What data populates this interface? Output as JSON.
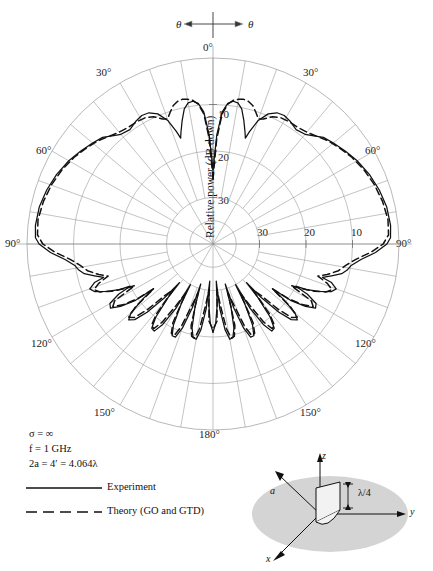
{
  "figure": {
    "top_axis": {
      "left_symbol": "θ",
      "right_symbol": "θ"
    },
    "radial_axis_title": "Relative power (dB down)"
  },
  "chart_data": {
    "type": "line",
    "plot_kind": "polar-radiation-pattern",
    "title": "",
    "xlabel": "θ (degrees)",
    "ylabel": "Relative power (dB down)",
    "angle_unit": "degrees",
    "angle_tick_labels": [
      "0°",
      "30°",
      "60°",
      "90°",
      "120°",
      "150°",
      "180°"
    ],
    "angle_ticks": [
      0,
      30,
      60,
      90,
      120,
      150,
      180
    ],
    "angle_range": [
      -180,
      180
    ],
    "radial_tick_labels": [
      "10",
      "20",
      "30"
    ],
    "radial_ticks_db_down": [
      10,
      20,
      30
    ],
    "radial_range_db_down": [
      0,
      40
    ],
    "radial_center_db_down": 40,
    "grid": true,
    "legend_position": "lower-left",
    "series": [
      {
        "name": "Experiment",
        "style": "solid",
        "color": "#111111",
        "points_deg_db": [
          [
            0,
            24.0
          ],
          [
            2,
            16.5
          ],
          [
            4,
            11.5
          ],
          [
            6,
            9.6
          ],
          [
            8,
            9.0
          ],
          [
            10,
            9.2
          ],
          [
            12,
            10.3
          ],
          [
            14,
            12.6
          ],
          [
            16,
            15.0
          ],
          [
            17,
            16.2
          ],
          [
            18,
            14.6
          ],
          [
            20,
            11.8
          ],
          [
            23,
            9.6
          ],
          [
            26,
            8.6
          ],
          [
            29,
            8.4
          ],
          [
            32,
            8.8
          ],
          [
            36,
            9.6
          ],
          [
            40,
            9.2
          ],
          [
            43,
            8.2
          ],
          [
            46,
            7.0
          ],
          [
            50,
            6.2
          ],
          [
            55,
            5.2
          ],
          [
            60,
            4.2
          ],
          [
            66,
            3.2
          ],
          [
            72,
            2.4
          ],
          [
            78,
            1.8
          ],
          [
            84,
            1.6
          ],
          [
            88,
            1.8
          ],
          [
            90,
            2.6
          ],
          [
            93,
            5.0
          ],
          [
            96,
            8.0
          ],
          [
            99,
            10.0
          ],
          [
            101,
            10.6
          ],
          [
            103,
            11.6
          ],
          [
            105,
            13.6
          ],
          [
            107,
            15.4
          ],
          [
            108,
            13.2
          ],
          [
            110,
            11.8
          ],
          [
            112,
            12.6
          ],
          [
            114,
            15.0
          ],
          [
            116,
            17.6
          ],
          [
            117,
            20.0
          ],
          [
            118,
            17.0
          ],
          [
            120,
            14.4
          ],
          [
            122,
            14.0
          ],
          [
            124,
            16.0
          ],
          [
            126,
            19.4
          ],
          [
            127,
            24.0
          ],
          [
            128,
            21.0
          ],
          [
            130,
            17.0
          ],
          [
            132,
            15.6
          ],
          [
            134,
            16.6
          ],
          [
            136,
            19.6
          ],
          [
            138,
            24.5
          ],
          [
            139,
            29.0
          ],
          [
            140,
            25.0
          ],
          [
            142,
            20.0
          ],
          [
            144,
            17.6
          ],
          [
            146,
            17.4
          ],
          [
            148,
            19.6
          ],
          [
            150,
            24.0
          ],
          [
            151,
            30.0
          ],
          [
            152,
            25.5
          ],
          [
            154,
            20.6
          ],
          [
            156,
            18.4
          ],
          [
            158,
            18.4
          ],
          [
            160,
            20.8
          ],
          [
            162,
            25.6
          ],
          [
            163,
            31.0
          ],
          [
            164,
            26.0
          ],
          [
            166,
            21.4
          ],
          [
            168,
            19.4
          ],
          [
            170,
            19.2
          ],
          [
            172,
            21.4
          ],
          [
            174,
            26.0
          ],
          [
            175,
            32.0
          ],
          [
            176,
            27.0
          ],
          [
            178,
            23.0
          ],
          [
            180,
            21.0
          ]
        ]
      },
      {
        "name": "Theory (GO and GTD)",
        "style": "dashed",
        "color": "#111111",
        "points_deg_db": [
          [
            0,
            26.0
          ],
          [
            2,
            17.5
          ],
          [
            4,
            12.0
          ],
          [
            6,
            9.8
          ],
          [
            8,
            8.8
          ],
          [
            10,
            8.4
          ],
          [
            12,
            8.2
          ],
          [
            14,
            8.4
          ],
          [
            16,
            9.0
          ],
          [
            18,
            10.2
          ],
          [
            20,
            11.4
          ],
          [
            22,
            11.0
          ],
          [
            25,
            9.8
          ],
          [
            28,
            9.2
          ],
          [
            32,
            9.0
          ],
          [
            36,
            9.0
          ],
          [
            40,
            8.6
          ],
          [
            44,
            7.8
          ],
          [
            48,
            6.8
          ],
          [
            53,
            5.8
          ],
          [
            58,
            4.8
          ],
          [
            64,
            3.8
          ],
          [
            70,
            3.0
          ],
          [
            76,
            2.4
          ],
          [
            82,
            2.0
          ],
          [
            87,
            2.2
          ],
          [
            90,
            3.4
          ],
          [
            93,
            6.0
          ],
          [
            96,
            9.0
          ],
          [
            99,
            11.0
          ],
          [
            102,
            12.4
          ],
          [
            105,
            14.6
          ],
          [
            107,
            16.4
          ],
          [
            109,
            14.0
          ],
          [
            111,
            12.6
          ],
          [
            113,
            13.6
          ],
          [
            115,
            16.0
          ],
          [
            117,
            19.0
          ],
          [
            118,
            21.0
          ],
          [
            120,
            15.6
          ],
          [
            122,
            14.6
          ],
          [
            124,
            16.6
          ],
          [
            126,
            20.0
          ],
          [
            127,
            24.0
          ],
          [
            129,
            18.6
          ],
          [
            131,
            16.0
          ],
          [
            133,
            16.8
          ],
          [
            135,
            20.0
          ],
          [
            137,
            25.0
          ],
          [
            139,
            27.0
          ],
          [
            141,
            20.6
          ],
          [
            143,
            18.0
          ],
          [
            145,
            17.8
          ],
          [
            147,
            20.0
          ],
          [
            149,
            24.6
          ],
          [
            151,
            28.0
          ],
          [
            153,
            21.0
          ],
          [
            155,
            18.8
          ],
          [
            157,
            18.6
          ],
          [
            159,
            21.0
          ],
          [
            161,
            26.0
          ],
          [
            163,
            29.0
          ],
          [
            165,
            21.8
          ],
          [
            167,
            19.6
          ],
          [
            169,
            19.4
          ],
          [
            171,
            21.6
          ],
          [
            173,
            26.4
          ],
          [
            175,
            30.0
          ],
          [
            177,
            23.4
          ],
          [
            180,
            21.6
          ]
        ]
      }
    ],
    "annotations": [
      {
        "text": "σ = ∞"
      },
      {
        "text": "f = 1 GHz"
      },
      {
        "text": "2a = 4′ = 4.064λ"
      }
    ]
  },
  "legend": {
    "items": [
      {
        "label": "Experiment",
        "style": "solid"
      },
      {
        "label": "Theory (GO and GTD)",
        "style": "dashed"
      }
    ]
  },
  "inset": {
    "axis_labels": [
      "z",
      "y",
      "x"
    ],
    "dimension_label": "a",
    "height_label": "λ/4"
  }
}
